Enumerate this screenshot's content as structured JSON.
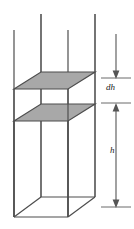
{
  "figure": {
    "type": "3d-wireframe-box-diagram",
    "title": "",
    "background_color": "#ffffff",
    "line_color": "#4d4d4d",
    "edge_color_dark": "#333333",
    "shade_fill_color": "#a8a8a8",
    "shade_edge_color": "#4d4d4d",
    "text_color": "#1a1a1a",
    "labels": {
      "dh": "dh",
      "h": "h"
    },
    "annotations": [
      {
        "name": "dh-dimension",
        "label": "dh",
        "meaning": "infinitesimal slab thickness between the two shaded planes",
        "arrow_style": "double-ended-inward",
        "tick_top_y": 78,
        "tick_bottom_y": 103
      },
      {
        "name": "h-dimension",
        "label": "h",
        "meaning": "height from the lower shaded plane down to the base of the box",
        "arrow_style": "double-ended-inward",
        "tick_top_y": 103,
        "tick_bottom_y": 207
      }
    ],
    "planes": [
      {
        "name": "upper-shaded-plane",
        "fill": "#a8a8a8"
      },
      {
        "name": "lower-shaded-plane",
        "fill": "#a8a8a8"
      }
    ],
    "box": {
      "name": "wireframe-box",
      "open_top": true,
      "vertical_edges_x": [
        14,
        41,
        68,
        95
      ],
      "base_front_y": 217,
      "base_back_y": 197
    }
  }
}
